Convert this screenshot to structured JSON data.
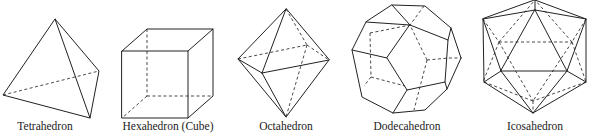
{
  "figure": {
    "solids": [
      {
        "id": "tetrahedron",
        "label": "Tetrahedron",
        "faces": 4
      },
      {
        "id": "hexahedron",
        "label": "Hexahedron (Cube)",
        "faces": 6
      },
      {
        "id": "octahedron",
        "label": "Octahedron",
        "faces": 8
      },
      {
        "id": "dodecahedron",
        "label": "Dodecahedron",
        "faces": 12
      },
      {
        "id": "icosahedron",
        "label": "Icosahedron",
        "faces": 20
      }
    ],
    "colors": {
      "line": "#222222",
      "background": "#ffffff"
    }
  }
}
